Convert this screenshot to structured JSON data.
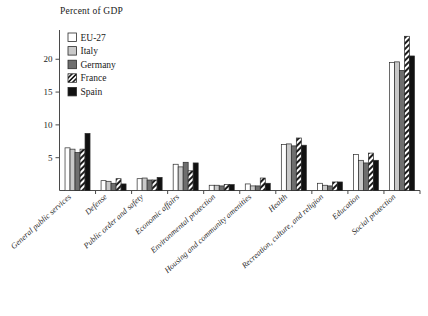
{
  "chart_data": {
    "type": "bar",
    "title": "",
    "ylabel": "Percent of GDP",
    "xlabel": "",
    "ylim": [
      0,
      24
    ],
    "yticks": [
      5,
      10,
      15,
      20
    ],
    "grid": false,
    "legend_position": "top-left",
    "categories": [
      "General public services",
      "Defense",
      "Public order and safety",
      "Economic affairs",
      "Environmental protection",
      "Housing and community amenities",
      "Health",
      "Recreation, culture, and religion",
      "Education",
      "Social protection"
    ],
    "series": [
      {
        "name": "EU-27",
        "fill": "#ffffff",
        "pattern": "solid",
        "values": [
          6.5,
          1.5,
          1.8,
          4.0,
          0.8,
          1.0,
          7.0,
          1.1,
          5.5,
          19.5
        ]
      },
      {
        "name": "Italy",
        "fill": "#c9c9c9",
        "pattern": "solid",
        "values": [
          6.3,
          1.4,
          1.9,
          3.6,
          0.8,
          0.7,
          7.1,
          0.8,
          4.6,
          19.6
        ]
      },
      {
        "name": "Germany",
        "fill": "#6e6e6e",
        "pattern": "solid",
        "values": [
          5.8,
          1.1,
          1.6,
          4.3,
          0.7,
          0.7,
          6.8,
          0.7,
          4.2,
          18.3
        ]
      },
      {
        "name": "France",
        "fill": "#ffffff",
        "pattern": "hatch",
        "values": [
          6.3,
          1.8,
          1.6,
          3.0,
          0.9,
          1.9,
          8.0,
          1.3,
          5.7,
          23.5
        ]
      },
      {
        "name": "Spain",
        "fill": "#111111",
        "pattern": "solid",
        "values": [
          8.7,
          1.0,
          2.0,
          4.2,
          0.9,
          1.1,
          6.9,
          1.3,
          4.6,
          20.5
        ]
      }
    ]
  },
  "legend": {
    "items": [
      {
        "label": "EU-27"
      },
      {
        "label": "Italy"
      },
      {
        "label": "Germany"
      },
      {
        "label": "France"
      },
      {
        "label": "Spain"
      }
    ]
  },
  "axis": {
    "y_title": "Percent of GDP",
    "y_tick_labels": [
      "5",
      "10",
      "15",
      "20"
    ]
  }
}
